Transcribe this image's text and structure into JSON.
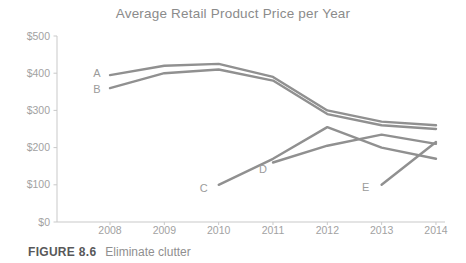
{
  "caption": {
    "figure_label": "FIGURE 8.6",
    "figure_title": "Eliminate clutter"
  },
  "chart_data": {
    "type": "line",
    "title": "Average Retail Product Price per Year",
    "x": [
      2008,
      2009,
      2010,
      2011,
      2012,
      2013,
      2014
    ],
    "series": [
      {
        "name": "A",
        "values": [
          395,
          420,
          425,
          390,
          300,
          270,
          260
        ]
      },
      {
        "name": "B",
        "values": [
          360,
          400,
          410,
          380,
          290,
          260,
          250
        ]
      },
      {
        "name": "C",
        "values": [
          null,
          null,
          100,
          170,
          255,
          200,
          170
        ]
      },
      {
        "name": "D",
        "values": [
          null,
          null,
          null,
          160,
          205,
          235,
          210
        ]
      },
      {
        "name": "E",
        "values": [
          null,
          null,
          null,
          null,
          null,
          100,
          215
        ]
      }
    ],
    "ylim": [
      0,
      500
    ],
    "y_tick_step": 100,
    "y_tick_labels": [
      "$0",
      "$100",
      "$200",
      "$300",
      "$400",
      "$500"
    ],
    "grid": false,
    "legend": "inline-labels-at-series-start",
    "line_color": "#909090",
    "label_color": "#9b9b9b",
    "tick_label_color": "#a2a2a2",
    "axis_color": "#c9c9c9",
    "series_label_offsets": {
      "A": [
        -13,
        2
      ],
      "B": [
        -13,
        5
      ],
      "C": [
        -15,
        7
      ],
      "D": [
        -10,
        11
      ],
      "E": [
        -16,
        6
      ]
    }
  }
}
